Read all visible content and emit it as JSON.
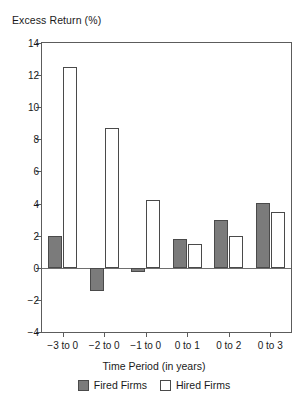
{
  "chart_data": {
    "type": "bar",
    "title": "",
    "ylabel": "Excess Return (%)",
    "xlabel": "Time Period (in years)",
    "categories": [
      "−3 to 0",
      "−2 to 0",
      "−1 to 0",
      "0 to 1",
      "0 to 2",
      "0 to 3"
    ],
    "series": [
      {
        "name": "Fired Firms",
        "color": "#7b7b7b",
        "values": [
          2.0,
          -1.45,
          -0.25,
          1.8,
          3.0,
          4.05
        ]
      },
      {
        "name": "Hired Firms",
        "color": "#ffffff",
        "values": [
          12.5,
          8.7,
          4.25,
          1.5,
          1.95,
          3.5
        ]
      }
    ],
    "ylim": [
      -4,
      14
    ],
    "yticks": [
      14,
      12,
      10,
      8,
      6,
      4,
      2,
      0,
      -2,
      -4
    ],
    "ytick_labels": [
      "14",
      "12",
      "10",
      "8",
      "6",
      "4",
      "2",
      "0",
      "−2",
      "−4"
    ],
    "grid": false,
    "legend_position": "bottom",
    "zero_line": true
  },
  "legend": {
    "entries": [
      {
        "label": "Fired Firms",
        "swatch": "filled-gray-swatch"
      },
      {
        "label": "Hired Firms",
        "swatch": "outlined-white-swatch"
      }
    ]
  }
}
